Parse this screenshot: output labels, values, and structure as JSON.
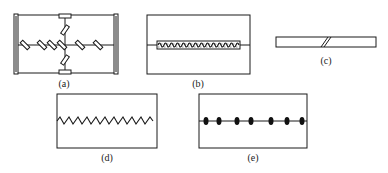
{
  "figure": {
    "panels": [
      {
        "id": "a",
        "label": "(a)",
        "description": "Rectangular frame with cross-shaped internal members carrying inclined spring/damper elements and end brackets"
      },
      {
        "id": "b",
        "label": "(b)",
        "description": "Rectangular frame with horizontal member encased in continuous coiled spring element"
      },
      {
        "id": "c",
        "label": "(c)",
        "description": "Thin slender bar with a double diagonal cut"
      },
      {
        "id": "d",
        "label": "(d)",
        "description": "Rectangular frame with horizontal zigzag member"
      },
      {
        "id": "e",
        "label": "(e)",
        "description": "Rectangular frame with horizontal member carrying seven discrete dark elliptical nodes"
      }
    ]
  },
  "colors": {
    "stroke": "#1a1a1a",
    "fill_dark": "#111111",
    "background": "#ffffff"
  }
}
